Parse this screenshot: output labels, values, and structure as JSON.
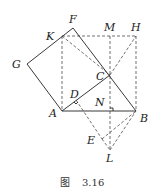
{
  "figure": {
    "caption_prefix": "图",
    "caption_number": "3.16",
    "points": [
      "A",
      "B",
      "C",
      "D",
      "E",
      "F",
      "G",
      "H",
      "K",
      "L",
      "M",
      "N"
    ],
    "labels": {
      "A": "A",
      "B": "B",
      "C": "C",
      "D": "D",
      "E": "E",
      "F": "F",
      "G": "G",
      "H": "H",
      "K": "K",
      "L": "L",
      "M": "M",
      "N": "N"
    },
    "solid_segments": [
      [
        "A",
        "B"
      ],
      [
        "B",
        "C"
      ],
      [
        "C",
        "F"
      ],
      [
        "F",
        "G"
      ],
      [
        "G",
        "A"
      ],
      [
        "A",
        "D"
      ],
      [
        "D",
        "C"
      ]
    ],
    "dashed_segments": [
      [
        "K",
        "H"
      ],
      [
        "H",
        "B"
      ],
      [
        "K",
        "A"
      ],
      [
        "K",
        "C"
      ],
      [
        "C",
        "H"
      ],
      [
        "M",
        "N"
      ],
      [
        "N",
        "L"
      ],
      [
        "A",
        "E"
      ],
      [
        "E",
        "B"
      ],
      [
        "E",
        "L"
      ],
      [
        "L",
        "B"
      ]
    ],
    "right_angle_marks": [
      "N"
    ]
  }
}
